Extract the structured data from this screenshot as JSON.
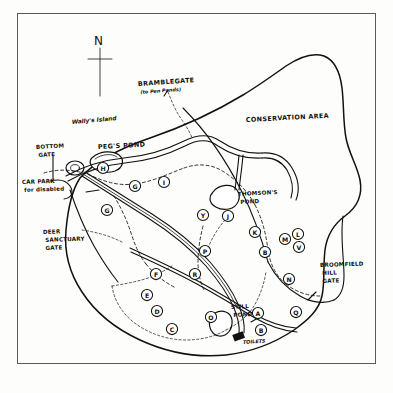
{
  "document": {
    "type": "hand-drawn park map",
    "title_visible": false
  },
  "compass": {
    "label": "N",
    "name": "north-arrow"
  },
  "place_labels": [
    {
      "id": "bramblegate",
      "text": "BRAMBLEGATE",
      "sub": "(to Pen Ponds)",
      "x": 138,
      "y": 86,
      "style": "cap",
      "rotate": -4
    },
    {
      "id": "conservation",
      "text": "CONSERVATION AREA",
      "sub": "",
      "x": 246,
      "y": 122,
      "style": "cap",
      "rotate": -3
    },
    {
      "id": "wallys-island",
      "text": "Wally's Island",
      "sub": "",
      "x": 72,
      "y": 124,
      "style": "mixed",
      "rotate": -5
    },
    {
      "id": "pegs-pond",
      "text": "PEG'S POND",
      "sub": "",
      "x": 98,
      "y": 149,
      "style": "cap",
      "rotate": -3
    },
    {
      "id": "bottom-gate",
      "text": "BOTTOM",
      "sub": "GATE",
      "x": 36,
      "y": 149,
      "style": "cap-sm",
      "rotate": -3
    },
    {
      "id": "car-park",
      "text": "CAR PARK",
      "sub": "for disabled",
      "x": 22,
      "y": 184,
      "style": "cap-sm",
      "rotate": -2
    },
    {
      "id": "deer-sanctuary",
      "text": "DEER",
      "sub": "SANCTUARY|GATE",
      "x": 43,
      "y": 234,
      "style": "cap-sm",
      "rotate": -2
    },
    {
      "id": "thomsons-pond",
      "text": "THOMSON'S",
      "sub": "POND",
      "x": 238,
      "y": 196,
      "style": "cap-sm",
      "rotate": -3
    },
    {
      "id": "broomfield",
      "text": "BROOMFIELD",
      "sub": "HILL|GATE",
      "x": 320,
      "y": 267,
      "style": "cap-sm",
      "rotate": -2
    },
    {
      "id": "still-pond",
      "text": "STILL",
      "sub": "POND",
      "x": 231,
      "y": 309,
      "style": "cap-sm",
      "rotate": -3
    },
    {
      "id": "toilets",
      "text": "TOILETS",
      "sub": "",
      "x": 243,
      "y": 344,
      "style": "lbl-sub",
      "rotate": -4
    }
  ],
  "markers": [
    {
      "letter": "H",
      "x": 103,
      "y": 168
    },
    {
      "letter": "G",
      "x": 135,
      "y": 186
    },
    {
      "letter": "G",
      "x": 107,
      "y": 210
    },
    {
      "letter": "I",
      "x": 164,
      "y": 182
    },
    {
      "letter": "Y",
      "x": 203,
      "y": 215
    },
    {
      "letter": "J",
      "x": 228,
      "y": 216
    },
    {
      "letter": "K",
      "x": 255,
      "y": 232
    },
    {
      "letter": "B",
      "x": 265,
      "y": 252
    },
    {
      "letter": "M",
      "x": 285,
      "y": 239
    },
    {
      "letter": "L",
      "x": 298,
      "y": 234
    },
    {
      "letter": "V",
      "x": 299,
      "y": 247
    },
    {
      "letter": "P",
      "x": 205,
      "y": 251
    },
    {
      "letter": "N",
      "x": 289,
      "y": 279
    },
    {
      "letter": "Q",
      "x": 296,
      "y": 312
    },
    {
      "letter": "R",
      "x": 195,
      "y": 274
    },
    {
      "letter": "F",
      "x": 156,
      "y": 274
    },
    {
      "letter": "E",
      "x": 147,
      "y": 295
    },
    {
      "letter": "D",
      "x": 157,
      "y": 311
    },
    {
      "letter": "C",
      "x": 172,
      "y": 329
    },
    {
      "letter": "O",
      "x": 211,
      "y": 317
    },
    {
      "letter": "A",
      "x": 258,
      "y": 313
    },
    {
      "letter": "B",
      "x": 261,
      "y": 330
    }
  ],
  "colors": {
    "ink": "#111111",
    "frame": "#5a5a5a",
    "paper": "#fdfdfb"
  }
}
